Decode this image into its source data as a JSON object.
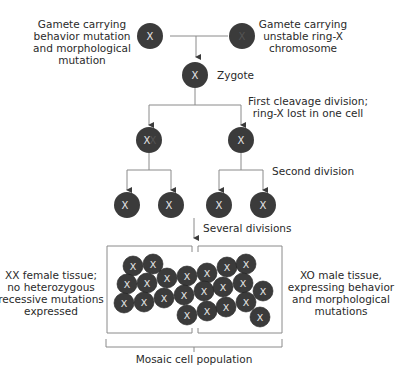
{
  "diagram": {
    "colors": {
      "cell": "#3b3b3b",
      "line": "#8a8a8a",
      "arrow": "#3b3b3b",
      "cell_label": "#e8e8e8",
      "ring_label": "#5a5a5a"
    },
    "gamete_left": {
      "label_lines": [
        "Gamete carrying",
        "behavior mutation",
        "and morphological",
        "mutation"
      ],
      "cell_text": "X"
    },
    "gamete_right": {
      "label_lines": [
        "Gamete carrying",
        "unstable ring-X",
        "chromosome"
      ],
      "cell_text": "X",
      "cell_text_note": "faint ring-X"
    },
    "zygote": {
      "label": "Zygote",
      "cell_text": "X"
    },
    "first_division": {
      "label_lines": [
        "First cleavage division;",
        "ring-X lost in one cell"
      ],
      "cells": [
        "X",
        "X"
      ]
    },
    "second_division": {
      "label": "Second division",
      "cells": [
        "X",
        "X",
        "X",
        "X"
      ]
    },
    "several_divisions": {
      "label": "Several divisions"
    },
    "mosaic": {
      "left_label_lines": [
        "XX female tissue;",
        "no heterozygous",
        "recessive mutations",
        "expressed"
      ],
      "right_label_lines": [
        "XO male tissue,",
        "expressing behavior",
        "and morphological",
        "mutations"
      ],
      "bottom_label": "Mosaic cell population",
      "cell_text": "X",
      "cell_count": 22
    }
  }
}
